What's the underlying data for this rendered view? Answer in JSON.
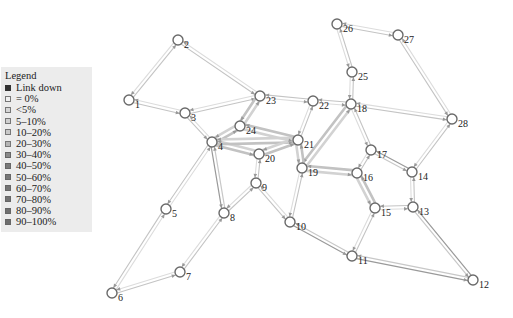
{
  "legend": {
    "title": "Legend",
    "items": [
      {
        "label": "Link down",
        "color": "#333333",
        "border": "#333333"
      },
      {
        "label": "= 0%",
        "color": "#f0f0f0",
        "border": "#777777"
      },
      {
        "label": "<5%",
        "color": "#d6d6d6",
        "border": "#777777"
      },
      {
        "label": "5–10%",
        "color": "#cfcfcf",
        "border": "#777777"
      },
      {
        "label": "10–20%",
        "color": "#c8c8c8",
        "border": "#777777"
      },
      {
        "label": "20–30%",
        "color": "#b5b5b5",
        "border": "#777777"
      },
      {
        "label": "30–40%",
        "color": "#8a8a8a",
        "border": "#666666"
      },
      {
        "label": "40–50%",
        "color": "#7a7a7a",
        "border": "#666666"
      },
      {
        "label": "50–60%",
        "color": "#777777",
        "border": "#666666"
      },
      {
        "label": "60–70%",
        "color": "#747474",
        "border": "#666666"
      },
      {
        "label": "70–80%",
        "color": "#727272",
        "border": "#666666"
      },
      {
        "label": "80–90%",
        "color": "#707070",
        "border": "#666666"
      },
      {
        "label": "90–100%",
        "color": "#6e6e6e",
        "border": "#666666"
      }
    ]
  },
  "graph": {
    "nodes": [
      {
        "id": "1",
        "x": 129,
        "y": 100
      },
      {
        "id": "2",
        "x": 178,
        "y": 40
      },
      {
        "id": "3",
        "x": 185,
        "y": 113
      },
      {
        "id": "4",
        "x": 212,
        "y": 142
      },
      {
        "id": "5",
        "x": 166,
        "y": 209
      },
      {
        "id": "6",
        "x": 112,
        "y": 293
      },
      {
        "id": "7",
        "x": 180,
        "y": 272
      },
      {
        "id": "8",
        "x": 224,
        "y": 213
      },
      {
        "id": "9",
        "x": 256,
        "y": 183
      },
      {
        "id": "10",
        "x": 290,
        "y": 222
      },
      {
        "id": "11",
        "x": 352,
        "y": 256
      },
      {
        "id": "12",
        "x": 473,
        "y": 280
      },
      {
        "id": "13",
        "x": 413,
        "y": 207
      },
      {
        "id": "14",
        "x": 412,
        "y": 172
      },
      {
        "id": "15",
        "x": 375,
        "y": 208
      },
      {
        "id": "16",
        "x": 357,
        "y": 173
      },
      {
        "id": "17",
        "x": 371,
        "y": 150
      },
      {
        "id": "18",
        "x": 351,
        "y": 104
      },
      {
        "id": "19",
        "x": 302,
        "y": 168
      },
      {
        "id": "20",
        "x": 259,
        "y": 154
      },
      {
        "id": "21",
        "x": 298,
        "y": 140
      },
      {
        "id": "22",
        "x": 313,
        "y": 101
      },
      {
        "id": "23",
        "x": 260,
        "y": 96
      },
      {
        "id": "24",
        "x": 240,
        "y": 126
      },
      {
        "id": "25",
        "x": 352,
        "y": 72
      },
      {
        "id": "26",
        "x": 337,
        "y": 24
      },
      {
        "id": "27",
        "x": 398,
        "y": 35
      },
      {
        "id": "28",
        "x": 452,
        "y": 119
      }
    ],
    "edges": [
      {
        "from": "1",
        "to": "2",
        "load": "light"
      },
      {
        "from": "1",
        "to": "3",
        "load": "light"
      },
      {
        "from": "2",
        "to": "23",
        "load": "light"
      },
      {
        "from": "3",
        "to": "23",
        "load": "light"
      },
      {
        "from": "3",
        "to": "4",
        "load": "light"
      },
      {
        "from": "4",
        "to": "24",
        "load": "heavy"
      },
      {
        "from": "4",
        "to": "20",
        "load": "heavy"
      },
      {
        "from": "4",
        "to": "21",
        "load": "heavy"
      },
      {
        "from": "4",
        "to": "5",
        "load": "light"
      },
      {
        "from": "4",
        "to": "8",
        "load": "medium"
      },
      {
        "from": "5",
        "to": "6",
        "load": "light"
      },
      {
        "from": "6",
        "to": "7",
        "load": "light"
      },
      {
        "from": "7",
        "to": "8",
        "load": "light"
      },
      {
        "from": "8",
        "to": "9",
        "load": "light"
      },
      {
        "from": "9",
        "to": "20",
        "load": "light"
      },
      {
        "from": "9",
        "to": "10",
        "load": "light"
      },
      {
        "from": "10",
        "to": "19",
        "load": "light"
      },
      {
        "from": "10",
        "to": "11",
        "load": "medium"
      },
      {
        "from": "11",
        "to": "15",
        "load": "light"
      },
      {
        "from": "11",
        "to": "12",
        "load": "medium"
      },
      {
        "from": "12",
        "to": "13",
        "load": "medium"
      },
      {
        "from": "13",
        "to": "15",
        "load": "light"
      },
      {
        "from": "13",
        "to": "14",
        "load": "light"
      },
      {
        "from": "14",
        "to": "17",
        "load": "medium"
      },
      {
        "from": "14",
        "to": "28",
        "load": "light"
      },
      {
        "from": "15",
        "to": "16",
        "load": "heavy"
      },
      {
        "from": "16",
        "to": "17",
        "load": "light"
      },
      {
        "from": "16",
        "to": "19",
        "load": "heavy"
      },
      {
        "from": "17",
        "to": "18",
        "load": "light"
      },
      {
        "from": "18",
        "to": "19",
        "load": "heavy"
      },
      {
        "from": "18",
        "to": "22",
        "load": "light"
      },
      {
        "from": "18",
        "to": "25",
        "load": "light"
      },
      {
        "from": "18",
        "to": "28",
        "load": "light"
      },
      {
        "from": "19",
        "to": "21",
        "load": "heavy"
      },
      {
        "from": "20",
        "to": "21",
        "load": "heavy"
      },
      {
        "from": "21",
        "to": "24",
        "load": "heavy"
      },
      {
        "from": "21",
        "to": "22",
        "load": "light"
      },
      {
        "from": "22",
        "to": "23",
        "load": "light"
      },
      {
        "from": "23",
        "to": "24",
        "load": "heavy"
      },
      {
        "from": "25",
        "to": "26",
        "load": "light"
      },
      {
        "from": "26",
        "to": "27",
        "load": "light"
      },
      {
        "from": "27",
        "to": "28",
        "load": "light"
      }
    ]
  }
}
